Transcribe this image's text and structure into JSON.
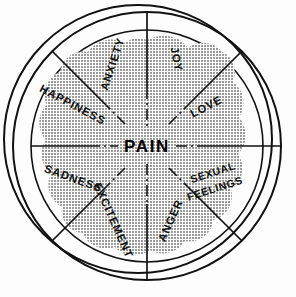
{
  "diagram": {
    "title": "PAIN",
    "center_label": "PAIN",
    "shape": "sphere-wheel",
    "background_color": "#fdfdfd",
    "blob_color": "#b4b4b4",
    "line_color": "#111111",
    "sectors": [
      {
        "label": "JOY",
        "angle_deg": -68,
        "name": "sector-joy"
      },
      {
        "label": "LOVE",
        "angle_deg": -23,
        "name": "sector-love"
      },
      {
        "label": "SEXUAL",
        "angle_deg": 22,
        "name": "sector-sexual-feelings-line1"
      },
      {
        "label": "FEELINGS",
        "angle_deg": 22,
        "name": "sector-sexual-feelings-line2"
      },
      {
        "label": "ANGER",
        "angle_deg": 67,
        "name": "sector-anger"
      },
      {
        "label": "EXCITEMENT",
        "angle_deg": 112,
        "name": "sector-excitement"
      },
      {
        "label": "SADNESS",
        "angle_deg": 157,
        "name": "sector-sadness"
      },
      {
        "label": "HAPPINESS",
        "angle_deg": 202,
        "name": "sector-happiness"
      },
      {
        "label": "ANXIETY",
        "angle_deg": 247,
        "name": "sector-anxiety"
      }
    ],
    "sector_labels": [
      "JOY",
      "LOVE",
      "SEXUAL FEELINGS",
      "ANGER",
      "EXCITEMENT",
      "SADNESS",
      "HAPPINESS",
      "ANXIETY"
    ]
  }
}
